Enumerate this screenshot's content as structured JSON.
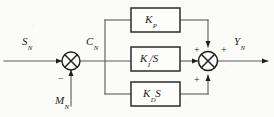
{
  "diagram": {
    "type": "control-system-block-diagram",
    "stroke_color": "#4d4d4d",
    "block_stroke_color": "#2b2b2b",
    "text_color": "#1d1d1d",
    "background_color": "#fbfbfa",
    "signals": {
      "input": {
        "base": "S",
        "sub": "N"
      },
      "error": {
        "base": "C",
        "sub": "N"
      },
      "feedback": {
        "base": "M",
        "sub": "N"
      },
      "output": {
        "base": "Y",
        "sub": "N"
      }
    },
    "blocks": [
      {
        "id": "proportional",
        "base": "K",
        "sub": "P",
        "suffix": ""
      },
      {
        "id": "integral",
        "base": "K",
        "sub": "I",
        "suffix": "/S"
      },
      {
        "id": "derivative",
        "base": "K",
        "sub": "D",
        "suffix": "S"
      }
    ],
    "junctions": [
      {
        "id": "error-junction",
        "glyph": "cross-circle",
        "signs": [
          {
            "label": "−",
            "position": "below-left"
          }
        ]
      },
      {
        "id": "sum-junction",
        "glyph": "cross-circle",
        "signs": [
          {
            "label": "+",
            "position": "left-upper"
          },
          {
            "label": "+",
            "position": "right-upper"
          },
          {
            "label": "+",
            "position": "left-lower"
          },
          {
            "label": "+",
            "position": "below-right"
          }
        ]
      }
    ]
  }
}
